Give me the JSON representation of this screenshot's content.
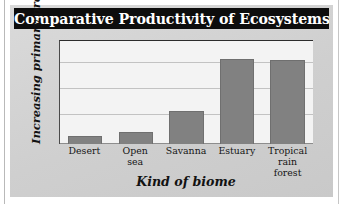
{
  "figure": {
    "title": "Comparative Productivity of Ecosystems"
  },
  "chart_data": {
    "type": "bar",
    "title": "Comparative Productivity of Ecosystems",
    "xlabel": "Kind of biome",
    "ylabel": "Increasing primary productivity",
    "categories": [
      "Desert",
      "Open sea",
      "Savanna",
      "Estuary",
      "Tropical rain forest"
    ],
    "category_lines": [
      [
        "Desert"
      ],
      [
        "Open",
        "sea"
      ],
      [
        "Savanna"
      ],
      [
        "Estuary"
      ],
      [
        "Tropical",
        "rain forest"
      ]
    ],
    "values": [
      8,
      12,
      32,
      83,
      82
    ],
    "ylim": [
      0,
      100
    ],
    "y_tick_labels": [],
    "gridlines_y": [
      25,
      50,
      75,
      100
    ],
    "grid": true,
    "legend": false,
    "bar_color": "#818181",
    "plot_background": "#f3f3f3",
    "panel_background": "#d4d4d4",
    "title_background": "#0d0d0d",
    "title_color": "#ffffff"
  }
}
